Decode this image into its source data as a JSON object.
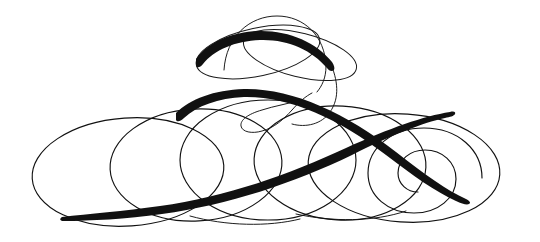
{
  "artwork": {
    "title": "Calligraphic Flourish Ornament",
    "kind": "decorative-flourish",
    "width": 540,
    "height": 242,
    "background_color": "#ffffff",
    "ink_color": "#111111",
    "bounds": {
      "left": 32,
      "right": 508,
      "top": 14,
      "bottom": 228
    },
    "stroke_weights": {
      "hairline": 1.0,
      "thin": 1.15,
      "swash_max": 8.5,
      "swash_tip": 0.4
    },
    "elements": [
      {
        "name": "top-arc-thin",
        "type": "arc",
        "description": "thin arc arching above the upper ellipses",
        "cx": 275,
        "cy": 57,
        "rx": 52,
        "ry": 40,
        "rotation": 0
      },
      {
        "name": "upper-left-ellipse",
        "type": "ellipse",
        "description": "tilted ellipse on the upper left, bold on its upper edge",
        "cx": 258,
        "cy": 52,
        "rx": 63,
        "ry": 24,
        "rotation": -12
      },
      {
        "name": "upper-right-ellipse",
        "type": "ellipse",
        "description": "tilted ellipse on the upper right crossing the left one",
        "cx": 300,
        "cy": 55,
        "rx": 58,
        "ry": 22,
        "rotation": 14
      },
      {
        "name": "center-teardrop-loop",
        "type": "loop",
        "description": "small tight teardrop loop at center, opening to the left",
        "cx": 268,
        "cy": 117,
        "rx": 28,
        "ry": 13,
        "rotation": -8
      },
      {
        "name": "body-ellipse-far-left",
        "type": "ellipse",
        "description": "large thin ellipse at far left of the body",
        "cx": 128,
        "cy": 172,
        "rx": 96,
        "ry": 54,
        "rotation": -4
      },
      {
        "name": "body-ellipse-left",
        "type": "ellipse",
        "description": "large thin ellipse left of center",
        "cx": 196,
        "cy": 165,
        "rx": 86,
        "ry": 56,
        "rotation": -3
      },
      {
        "name": "body-ellipse-center",
        "type": "ellipse",
        "description": "thin ellipse through the center of the body",
        "cx": 268,
        "cy": 160,
        "rx": 88,
        "ry": 60,
        "rotation": 0
      },
      {
        "name": "body-ellipse-right",
        "type": "ellipse",
        "description": "thin ellipse right of center",
        "cx": 340,
        "cy": 163,
        "rx": 86,
        "ry": 57,
        "rotation": 3
      },
      {
        "name": "body-ellipse-far-right",
        "type": "ellipse",
        "description": "large thin ellipse at far right of the body",
        "cx": 404,
        "cy": 168,
        "rx": 96,
        "ry": 54,
        "rotation": 4
      },
      {
        "name": "right-spiral",
        "type": "spiral",
        "description": "spiral terminal curling inward, ending in a fine tip",
        "cx": 424,
        "cy": 178,
        "turns": 1.6,
        "outer_r": 58,
        "inner_r": 12
      },
      {
        "name": "main-swash-descending",
        "type": "swash",
        "description": "bold tapering swash sweeping from the upper-left crest down to the right",
        "start": [
          176,
          112
        ],
        "crest": [
          250,
          93
        ],
        "end": [
          470,
          196
        ],
        "max_width": 8.5
      },
      {
        "name": "main-swash-ascending",
        "type": "swash",
        "description": "bold tapering swash rising from the lower-left tip to the upper right",
        "start": [
          62,
          216
        ],
        "end": [
          452,
          120
        ],
        "max_width": 8.0
      },
      {
        "name": "upper-swash-accent",
        "type": "swash",
        "description": "bold accent on the upper-left ellipse crown",
        "start": [
          198,
          58
        ],
        "end": [
          330,
          72
        ],
        "max_width": 7.0
      }
    ]
  }
}
